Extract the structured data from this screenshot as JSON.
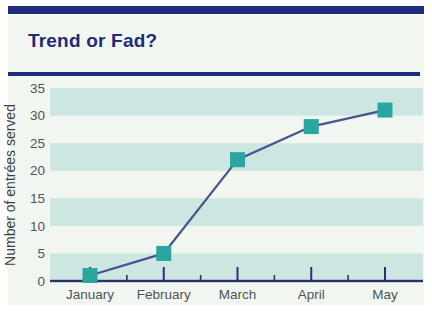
{
  "header": {
    "title": "Trend or Fad?"
  },
  "colors": {
    "navy": "#1f2b7b",
    "card_background": "#f1f7f0",
    "band_teal": "#cde6e2",
    "marker_teal": "#2aa5a0",
    "trend_line": "#47548e",
    "axis": "#28336e",
    "tick_text": "#4f5457",
    "axis_title_text": "#3c4043"
  },
  "chart_data": {
    "type": "line",
    "title": "Trend or Fad?",
    "categories": [
      "January",
      "February",
      "March",
      "April",
      "May"
    ],
    "values": [
      1,
      5,
      22,
      28,
      31
    ],
    "xlabel": "",
    "ylabel": "Number of entrées served",
    "ylim": [
      0,
      35
    ],
    "yticks": [
      0,
      5,
      10,
      15,
      20,
      25,
      30,
      35
    ],
    "grid": "alternating-horizontal-bands",
    "legend": "none",
    "marker": "square"
  }
}
